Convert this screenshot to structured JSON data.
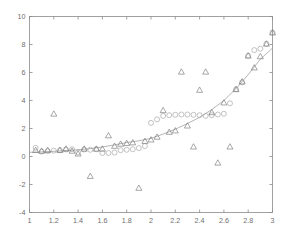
{
  "chart_data": {
    "type": "scatter",
    "title": "",
    "xlabel": "",
    "ylabel": "",
    "xlim": [
      1,
      3
    ],
    "ylim": [
      -4,
      10
    ],
    "grid": false,
    "legend": "none",
    "xticks": [
      "1",
      "1.2",
      "1.4",
      "1.6",
      "1.8",
      "2",
      "2.2",
      "2.4",
      "2.6",
      "2.8",
      "3"
    ],
    "xtick_values": [
      1,
      1.2,
      1.4,
      1.6,
      1.8,
      2,
      2.2,
      2.4,
      2.6,
      2.8,
      3
    ],
    "yticks": [
      "10",
      "8",
      "6",
      "4",
      "2",
      "0",
      "-2",
      "-4"
    ],
    "ytick_values": [
      10,
      8,
      6,
      4,
      2,
      0,
      -2,
      -4
    ],
    "series": [
      {
        "name": "noisy-observations",
        "marker": "triangle",
        "color": "#6e6e6e",
        "x": [
          1.05,
          1.1,
          1.15,
          1.2,
          1.25,
          1.3,
          1.35,
          1.4,
          1.45,
          1.5,
          1.55,
          1.6,
          1.65,
          1.7,
          1.75,
          1.8,
          1.85,
          1.9,
          1.95,
          2.0,
          2.05,
          2.1,
          2.15,
          2.2,
          2.25,
          2.3,
          2.35,
          2.4,
          2.45,
          2.5,
          2.55,
          2.6,
          2.65,
          2.7,
          2.75,
          2.8,
          2.85,
          2.9,
          2.95,
          3.0
        ],
        "y": [
          0.45,
          0.4,
          0.45,
          3.05,
          0.45,
          0.55,
          0.4,
          0.2,
          0.55,
          -1.4,
          0.55,
          0.55,
          1.5,
          0.75,
          0.9,
          0.95,
          1.0,
          -2.25,
          1.1,
          1.2,
          1.4,
          3.3,
          1.75,
          1.85,
          6.05,
          2.2,
          0.7,
          4.75,
          6.05,
          3.15,
          -0.45,
          3.85,
          0.7,
          4.8,
          5.35,
          7.2,
          6.35,
          7.15,
          8.05,
          8.85
        ]
      },
      {
        "name": "smoothed-estimate",
        "marker": "circle",
        "color": "#9a9a9a",
        "x": [
          1.05,
          1.1,
          1.15,
          1.2,
          1.25,
          1.3,
          1.35,
          1.4,
          1.45,
          1.5,
          1.55,
          1.6,
          1.65,
          1.7,
          1.75,
          1.8,
          1.85,
          1.9,
          1.95,
          2.0,
          2.05,
          2.1,
          2.15,
          2.2,
          2.25,
          2.3,
          2.35,
          2.4,
          2.45,
          2.5,
          2.55,
          2.6,
          2.65,
          2.7,
          2.75,
          2.8,
          2.85,
          2.9,
          2.95,
          3.0
        ],
        "y": [
          0.62,
          0.35,
          0.38,
          0.42,
          0.45,
          0.5,
          0.52,
          0.3,
          0.5,
          0.48,
          0.52,
          0.25,
          0.25,
          0.28,
          0.45,
          0.48,
          0.52,
          0.6,
          0.75,
          2.4,
          2.65,
          2.9,
          2.95,
          2.98,
          3.0,
          3.0,
          2.98,
          2.95,
          2.9,
          2.95,
          3.0,
          3.05,
          3.8,
          4.8,
          5.3,
          7.2,
          7.6,
          7.7,
          8.05,
          8.85
        ]
      },
      {
        "name": "fitted-curve",
        "marker": "line",
        "color": "#8d8d8d",
        "x": [
          1.0,
          1.1,
          1.2,
          1.3,
          1.4,
          1.5,
          1.6,
          1.7,
          1.8,
          1.9,
          2.0,
          2.1,
          2.2,
          2.3,
          2.4,
          2.5,
          2.6,
          2.7,
          2.8,
          2.9,
          3.0
        ],
        "y": [
          0.3,
          0.33,
          0.37,
          0.42,
          0.48,
          0.56,
          0.68,
          0.83,
          1.0,
          1.12,
          1.3,
          1.6,
          1.95,
          2.35,
          2.8,
          3.35,
          4.0,
          4.85,
          5.85,
          6.95,
          7.75
        ]
      }
    ],
    "annotations": []
  },
  "axes": {
    "x_axis_name": "x-axis",
    "y_axis_name": "y-axis"
  }
}
